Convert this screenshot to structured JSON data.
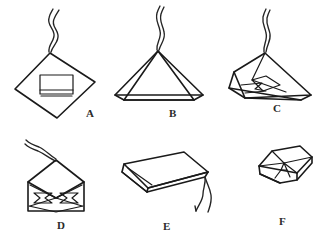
{
  "plate": {
    "width": 327,
    "height": 236,
    "background_color": "#ffffff",
    "ink_color": "#1a1a1a",
    "caption": ""
  },
  "panels": [
    {
      "id": "panel-a",
      "label": "A",
      "label_x": 86,
      "label_y": 108,
      "description": "diamond-shaped folded paper with small rectangular patch at center and doubled wavy thread rising from top vertex",
      "shape_name": "diamond-folded-paper"
    },
    {
      "id": "panel-b",
      "label": "B",
      "label_x": 169,
      "label_y": 108,
      "description": "wide low triangular tent form with inner triangle fold and doubled wavy thread from apex",
      "shape_name": "triangular-tent-paper"
    },
    {
      "id": "panel-c",
      "label": "C",
      "label_x": 273,
      "label_y": 103,
      "description": "angular creased wedge with inner folded flap and arrow notch, thread rising from upper vertex",
      "shape_name": "creased-wedge-paper"
    },
    {
      "id": "panel-d",
      "label": "D",
      "label_x": 57,
      "label_y": 220,
      "description": "envelope form, square body with triangular top flap and interior bowtie crease pattern, thread from top",
      "shape_name": "envelope-bowtie-paper"
    },
    {
      "id": "panel-e",
      "label": "E",
      "label_x": 163,
      "label_y": 221,
      "description": "flat slab parallelogram seen in perspective with thin folded lip and thread hanging at right",
      "shape_name": "flat-slab-paper"
    },
    {
      "id": "panel-f",
      "label": "F",
      "label_x": 279,
      "label_y": 216,
      "description": "small flat square pillow folded in quarters seen in perspective",
      "shape_name": "quarter-folded-pillow-paper"
    }
  ]
}
